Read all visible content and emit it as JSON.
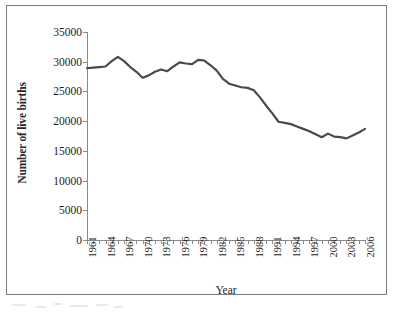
{
  "chart_data": {
    "type": "line",
    "title": "",
    "xlabel": "Year",
    "ylabel": "Number of live births",
    "ylim": [
      0,
      35000
    ],
    "ytick_values": [
      0,
      5000,
      10000,
      15000,
      20000,
      25000,
      30000,
      35000
    ],
    "ytick_labels": [
      "0",
      "5000",
      "10000",
      "15000",
      "20000",
      "25000",
      "30000",
      "35000"
    ],
    "xlim": [
      1961,
      2006
    ],
    "xtick_labels": [
      "1961",
      "1964",
      "1967",
      "1970",
      "1973",
      "1976",
      "1979",
      "1982",
      "1985",
      "1988",
      "1991",
      "1994",
      "1997",
      "2000",
      "2003",
      "2006"
    ],
    "xtick_step": 3,
    "grid": false,
    "legend": false,
    "line_color": "#4a4a4a",
    "line_width": 2.2,
    "axis_color": "#8a8a8a",
    "frame_color": "#7d7d7d",
    "series": [
      {
        "name": "Number of live births",
        "x": [
          1961,
          1962,
          1963,
          1964,
          1965,
          1966,
          1967,
          1968,
          1969,
          1970,
          1971,
          1972,
          1973,
          1974,
          1975,
          1976,
          1977,
          1978,
          1979,
          1980,
          1981,
          1982,
          1983,
          1984,
          1985,
          1986,
          1987,
          1988,
          1989,
          1990,
          1991,
          1992,
          1993,
          1994,
          1995,
          1996,
          1997,
          1998,
          1999,
          2000,
          2001,
          2002,
          2003,
          2004,
          2005,
          2006
        ],
        "values": [
          28900,
          29000,
          29100,
          29200,
          30100,
          30800,
          30100,
          29100,
          28300,
          27300,
          27700,
          28300,
          28700,
          28400,
          29200,
          29900,
          29700,
          29600,
          30300,
          30200,
          29400,
          28500,
          27100,
          26300,
          26000,
          25700,
          25600,
          25200,
          24000,
          22600,
          21300,
          19900,
          19700,
          19500,
          19100,
          18700,
          18300,
          17800,
          17300,
          17900,
          17400,
          17300,
          17100,
          17600,
          18100,
          18700
        ]
      }
    ]
  },
  "figure": {
    "ylabel_text": "Number of live births",
    "xlabel_text": "Year"
  }
}
